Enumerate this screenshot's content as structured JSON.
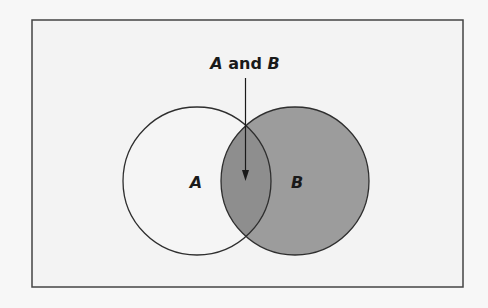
{
  "diagram": {
    "type": "venn",
    "title_label": "A and B",
    "title_parts": {
      "a": "A",
      "and": " and ",
      "b": "B"
    },
    "sets": [
      {
        "name": "A",
        "label": "A",
        "shaded": false
      },
      {
        "name": "B",
        "label": "B",
        "shaded": true
      }
    ],
    "intersection": {
      "label": "A and B",
      "shaded": true
    },
    "colors": {
      "frame_background": "#f3f3f3",
      "frame_border": "#444444",
      "circle_stroke": "#2e2e2e",
      "set_a_fill": "#f5f5f5",
      "set_b_fill": "#9c9c9c",
      "intersection_fill": "#8e8e8e",
      "text": "#1a1a1a"
    }
  }
}
